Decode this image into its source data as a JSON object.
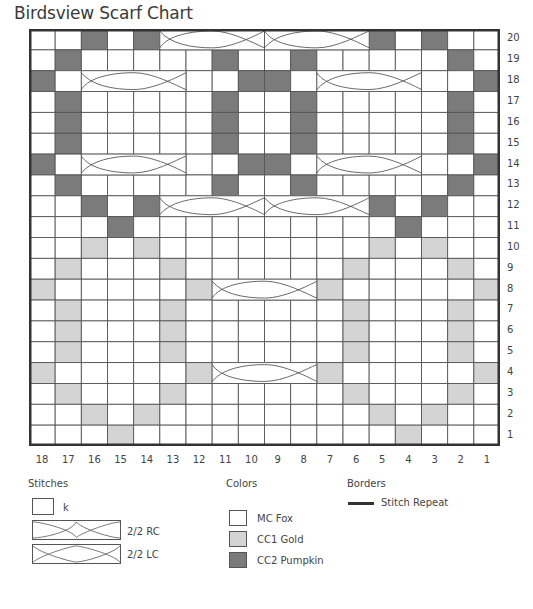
{
  "title": "Birdsview Scarf Chart",
  "colors": {
    "mc": "#ffffff",
    "cc1": "#d4d4d4",
    "cc2": "#7b7b7b",
    "grid_line": "#444444",
    "border": "#333333"
  },
  "chart_data": {
    "type": "table",
    "title": "Birdsview Scarf Chart",
    "columns": 18,
    "rows": 20,
    "column_labels": [
      "18",
      "17",
      "16",
      "15",
      "14",
      "13",
      "12",
      "11",
      "10",
      "9",
      "8",
      "7",
      "6",
      "5",
      "4",
      "3",
      "2",
      "1"
    ],
    "row_labels": [
      "20",
      "19",
      "18",
      "17",
      "16",
      "15",
      "14",
      "13",
      "12",
      "11",
      "10",
      "9",
      "8",
      "7",
      "6",
      "5",
      "4",
      "3",
      "2",
      "1"
    ],
    "cell_legend": {
      "0": "MC Fox",
      "1": "CC1 Gold",
      "2": "CC2 Pumpkin"
    },
    "grid_note": "grid rows listed top (row 20) to bottom (row 1); columns left (18) to right (1)",
    "grid": [
      [
        0,
        0,
        2,
        0,
        2,
        0,
        0,
        0,
        0,
        0,
        0,
        0,
        0,
        2,
        0,
        2,
        0,
        0
      ],
      [
        0,
        2,
        0,
        0,
        0,
        0,
        0,
        2,
        0,
        0,
        2,
        0,
        0,
        0,
        0,
        0,
        2,
        0
      ],
      [
        2,
        0,
        0,
        0,
        0,
        0,
        0,
        0,
        2,
        2,
        0,
        0,
        0,
        0,
        0,
        0,
        0,
        2
      ],
      [
        0,
        2,
        0,
        0,
        0,
        0,
        0,
        2,
        0,
        0,
        2,
        0,
        0,
        0,
        0,
        0,
        2,
        0
      ],
      [
        0,
        2,
        0,
        0,
        0,
        0,
        0,
        2,
        0,
        0,
        2,
        0,
        0,
        0,
        0,
        0,
        2,
        0
      ],
      [
        0,
        2,
        0,
        0,
        0,
        0,
        0,
        2,
        0,
        0,
        2,
        0,
        0,
        0,
        0,
        0,
        2,
        0
      ],
      [
        2,
        0,
        0,
        0,
        0,
        0,
        0,
        0,
        2,
        2,
        0,
        0,
        0,
        0,
        0,
        0,
        0,
        2
      ],
      [
        0,
        2,
        0,
        0,
        0,
        0,
        0,
        2,
        0,
        0,
        2,
        0,
        0,
        0,
        0,
        0,
        2,
        0
      ],
      [
        0,
        0,
        2,
        0,
        2,
        0,
        0,
        0,
        0,
        0,
        0,
        0,
        0,
        2,
        0,
        2,
        0,
        0
      ],
      [
        0,
        0,
        0,
        2,
        0,
        0,
        0,
        0,
        0,
        0,
        0,
        0,
        0,
        0,
        2,
        0,
        0,
        0
      ],
      [
        0,
        0,
        1,
        0,
        1,
        0,
        0,
        0,
        0,
        0,
        0,
        0,
        0,
        1,
        0,
        1,
        0,
        0
      ],
      [
        0,
        1,
        0,
        0,
        0,
        1,
        0,
        0,
        0,
        0,
        0,
        0,
        1,
        0,
        0,
        0,
        1,
        0
      ],
      [
        1,
        0,
        0,
        0,
        0,
        0,
        1,
        0,
        0,
        0,
        0,
        1,
        0,
        0,
        0,
        0,
        0,
        1
      ],
      [
        0,
        1,
        0,
        0,
        0,
        1,
        0,
        0,
        0,
        0,
        0,
        0,
        1,
        0,
        0,
        0,
        1,
        0
      ],
      [
        0,
        1,
        0,
        0,
        0,
        1,
        0,
        0,
        0,
        0,
        0,
        0,
        1,
        0,
        0,
        0,
        1,
        0
      ],
      [
        0,
        1,
        0,
        0,
        0,
        1,
        0,
        0,
        0,
        0,
        0,
        0,
        1,
        0,
        0,
        0,
        1,
        0
      ],
      [
        1,
        0,
        0,
        0,
        0,
        0,
        1,
        0,
        0,
        0,
        0,
        1,
        0,
        0,
        0,
        0,
        0,
        1
      ],
      [
        0,
        1,
        0,
        0,
        0,
        1,
        0,
        0,
        0,
        0,
        0,
        0,
        1,
        0,
        0,
        0,
        1,
        0
      ],
      [
        0,
        0,
        1,
        0,
        1,
        0,
        0,
        0,
        0,
        0,
        0,
        0,
        0,
        1,
        0,
        1,
        0,
        0
      ],
      [
        0,
        0,
        0,
        1,
        0,
        0,
        0,
        0,
        0,
        0,
        0,
        0,
        0,
        0,
        1,
        0,
        0,
        0
      ]
    ],
    "cables": [
      {
        "row": 20,
        "from_col": 13,
        "to_col": 10,
        "type": "2/2 RC"
      },
      {
        "row": 20,
        "from_col": 9,
        "to_col": 6,
        "type": "2/2 LC"
      },
      {
        "row": 18,
        "from_col": 16,
        "to_col": 13,
        "type": "2/2 RC"
      },
      {
        "row": 18,
        "from_col": 7,
        "to_col": 4,
        "type": "2/2 LC"
      },
      {
        "row": 14,
        "from_col": 16,
        "to_col": 13,
        "type": "2/2 LC"
      },
      {
        "row": 14,
        "from_col": 7,
        "to_col": 4,
        "type": "2/2 RC"
      },
      {
        "row": 12,
        "from_col": 13,
        "to_col": 10,
        "type": "2/2 LC"
      },
      {
        "row": 12,
        "from_col": 9,
        "to_col": 6,
        "type": "2/2 RC"
      },
      {
        "row": 8,
        "from_col": 11,
        "to_col": 8,
        "type": "2/2 RC"
      },
      {
        "row": 4,
        "from_col": 11,
        "to_col": 8,
        "type": "2/2 LC"
      }
    ]
  },
  "legend": {
    "stitches": {
      "heading": "Stitches",
      "items": [
        {
          "symbol": "empty-square",
          "label": "k"
        },
        {
          "symbol": "cable-rc",
          "label": "2/2 RC"
        },
        {
          "symbol": "cable-lc",
          "label": "2/2 LC"
        }
      ]
    },
    "colors": {
      "heading": "Colors",
      "items": [
        {
          "label": "MC Fox",
          "color": "#ffffff"
        },
        {
          "label": "CC1 Gold",
          "color": "#d4d4d4"
        },
        {
          "label": "CC2 Pumpkin",
          "color": "#7b7b7b"
        }
      ]
    },
    "borders": {
      "heading": "Borders",
      "items": [
        {
          "symbol": "thick-line",
          "label": "Stitch Repeat"
        }
      ]
    }
  }
}
